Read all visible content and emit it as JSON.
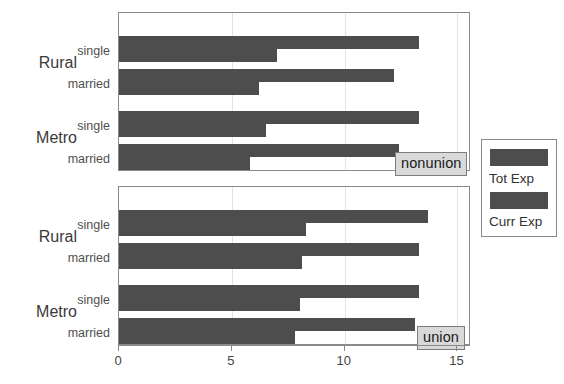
{
  "chart_data": {
    "type": "bar",
    "orientation": "horizontal",
    "title": "",
    "xlabel": "",
    "ylabel": "",
    "xlim": [
      0,
      15.6
    ],
    "xticks": [
      0,
      5,
      10,
      15
    ],
    "xticklabels": [
      "0",
      "5",
      "10",
      "15"
    ],
    "grid": "vertical-only",
    "legend": {
      "position": "right",
      "entries": [
        {
          "name": "Tot Exp",
          "color": "#4d4d4d"
        },
        {
          "name": "Curr Exp",
          "color": "#4d4d4d"
        }
      ]
    },
    "panels": [
      {
        "strip_label": "nonunion",
        "groups": [
          {
            "region": "Rural",
            "marital": "single",
            "Tot Exp": 13.3,
            "Curr Exp": 7.0
          },
          {
            "region": "Rural",
            "marital": "married",
            "Tot Exp": 12.2,
            "Curr Exp": 6.2
          },
          {
            "region": "Metro",
            "marital": "single",
            "Tot Exp": 13.3,
            "Curr Exp": 6.5
          },
          {
            "region": "Metro",
            "marital": "married",
            "Tot Exp": 12.4,
            "Curr Exp": 5.8
          }
        ]
      },
      {
        "strip_label": "union",
        "groups": [
          {
            "region": "Rural",
            "marital": "single",
            "Tot Exp": 13.7,
            "Curr Exp": 8.3
          },
          {
            "region": "Rural",
            "marital": "married",
            "Tot Exp": 13.3,
            "Curr Exp": 8.1
          },
          {
            "region": "Metro",
            "marital": "single",
            "Tot Exp": 13.3,
            "Curr Exp": 8.0
          },
          {
            "region": "Metro",
            "marital": "married",
            "Tot Exp": 13.1,
            "Curr Exp": 7.8
          }
        ]
      }
    ],
    "y_region_labels": [
      "Rural",
      "Metro"
    ],
    "y_marital_labels": [
      "single",
      "married"
    ],
    "series_names": [
      "Tot Exp",
      "Curr Exp"
    ],
    "bar_color": "#4d4d4d",
    "panel_border_color": "#8a8a8a",
    "strip_background": "#d9d9d9"
  }
}
